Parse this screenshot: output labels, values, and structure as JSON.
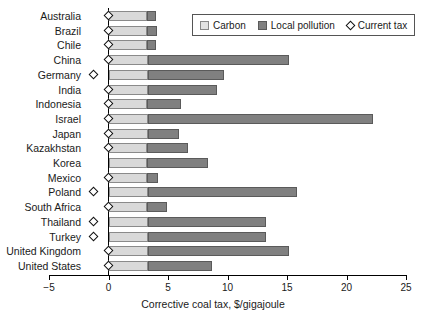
{
  "chart_data": {
    "type": "bar",
    "orientation": "horizontal",
    "stacked": true,
    "title": "",
    "xlabel": "Corrective coal tax, $/gigajoule",
    "ylabel": "",
    "xlim": [
      -5,
      25
    ],
    "xticks": [
      -5,
      0,
      5,
      10,
      15,
      20,
      25
    ],
    "xtick_labels": [
      "−5",
      "0",
      "5",
      "10",
      "15",
      "20",
      "25"
    ],
    "grid": false,
    "legend_position": "top-right",
    "legend": [
      "Carbon",
      "Local pollution",
      "Current tax"
    ],
    "categories": [
      "Australia",
      "Brazil",
      "Chile",
      "China",
      "Germany",
      "India",
      "Indonesia",
      "Israel",
      "Japan",
      "Kazakhstan",
      "Korea",
      "Mexico",
      "Poland",
      "South Africa",
      "Thailand",
      "Turkey",
      "United Kingdom",
      "United States"
    ],
    "series": [
      {
        "name": "Carbon",
        "color": "#d9d9d9",
        "values": [
          3.2,
          3.2,
          3.2,
          3.3,
          3.3,
          3.3,
          3.2,
          3.3,
          3.3,
          3.2,
          3.2,
          3.2,
          3.3,
          3.2,
          3.3,
          3.3,
          3.3,
          3.3
        ]
      },
      {
        "name": "Local pollution",
        "color": "#808080",
        "values": [
          0.8,
          0.9,
          0.8,
          11.9,
          6.4,
          5.8,
          2.9,
          18.9,
          2.6,
          3.5,
          5.2,
          1.0,
          12.5,
          1.7,
          9.9,
          9.9,
          11.9,
          5.4
        ]
      }
    ],
    "markers": {
      "name": "Current tax",
      "symbol": "diamond",
      "values": [
        0,
        0,
        0,
        0,
        -1.3,
        0,
        0,
        0,
        0,
        0,
        null,
        0,
        -1.3,
        0,
        -1.3,
        -1.3,
        0,
        0
      ]
    }
  },
  "legend": {
    "carbon_label": "Carbon",
    "local_label": "Local pollution",
    "tax_label": "Current tax"
  },
  "axis": {
    "x_title": "Corrective coal tax, $/gigajoule"
  }
}
